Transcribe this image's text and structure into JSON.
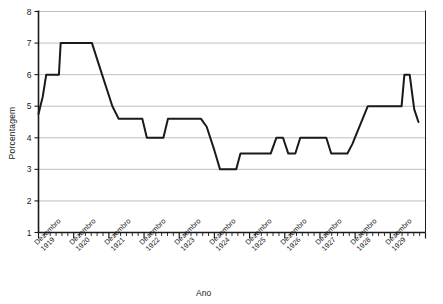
{
  "chart_data": {
    "type": "line",
    "title": "",
    "xlabel": "Ano",
    "ylabel": "Porcentagem",
    "ylim": [
      1,
      8
    ],
    "yticks": [
      1,
      2,
      3,
      4,
      5,
      6,
      7,
      8
    ],
    "grid": true,
    "legend": false,
    "categories": [
      "Dezembro 1919",
      "Dezembro 1920",
      "Dezembro 1921",
      "Dezembro 1922",
      "Dezembro 1923",
      "Dezembro 1924",
      "Dezembro 1925",
      "Dezembro 1926",
      "Dezembro 1927",
      "Dezembro 1928",
      "Dezembro 1929"
    ],
    "xtick_labels_line1": [
      "Dezembro",
      "Dezembro",
      "Dezembro",
      "Dezembro",
      "Dezembro",
      "Dezembro",
      "Dezembro",
      "Dezembro",
      "Dezembro",
      "Dezembro",
      "Dezembro"
    ],
    "xtick_labels_line2": [
      "1919",
      "1920",
      "1921",
      "1922",
      "1923",
      "1924",
      "1925",
      "1926",
      "1927",
      "1928",
      "1929"
    ],
    "series": [
      {
        "name": "Taxa de desconto",
        "color": "#1a1a1a",
        "points": [
          {
            "x": 1919.0,
            "y": 4.75
          },
          {
            "x": 1919.12,
            "y": 5.3
          },
          {
            "x": 1919.22,
            "y": 6.0
          },
          {
            "x": 1919.58,
            "y": 6.0
          },
          {
            "x": 1919.63,
            "y": 7.0
          },
          {
            "x": 1920.52,
            "y": 7.0
          },
          {
            "x": 1920.75,
            "y": 6.2
          },
          {
            "x": 1921.1,
            "y": 5.0
          },
          {
            "x": 1921.28,
            "y": 4.6
          },
          {
            "x": 1921.95,
            "y": 4.6
          },
          {
            "x": 1922.08,
            "y": 4.0
          },
          {
            "x": 1922.55,
            "y": 4.0
          },
          {
            "x": 1922.68,
            "y": 4.6
          },
          {
            "x": 1923.62,
            "y": 4.6
          },
          {
            "x": 1923.78,
            "y": 4.35
          },
          {
            "x": 1924.0,
            "y": 3.6
          },
          {
            "x": 1924.16,
            "y": 3.0
          },
          {
            "x": 1924.62,
            "y": 3.0
          },
          {
            "x": 1924.74,
            "y": 3.5
          },
          {
            "x": 1925.6,
            "y": 3.5
          },
          {
            "x": 1925.76,
            "y": 4.0
          },
          {
            "x": 1925.95,
            "y": 4.0
          },
          {
            "x": 1926.1,
            "y": 3.5
          },
          {
            "x": 1926.3,
            "y": 3.5
          },
          {
            "x": 1926.44,
            "y": 4.0
          },
          {
            "x": 1927.18,
            "y": 4.0
          },
          {
            "x": 1927.32,
            "y": 3.5
          },
          {
            "x": 1927.78,
            "y": 3.5
          },
          {
            "x": 1927.92,
            "y": 3.8
          },
          {
            "x": 1928.36,
            "y": 5.0
          },
          {
            "x": 1928.52,
            "y": 5.0
          },
          {
            "x": 1929.32,
            "y": 5.0
          },
          {
            "x": 1929.4,
            "y": 6.0
          },
          {
            "x": 1929.55,
            "y": 6.0
          },
          {
            "x": 1929.68,
            "y": 4.9
          },
          {
            "x": 1929.8,
            "y": 4.5
          }
        ]
      }
    ],
    "axis_colors": {
      "axis": "#1a1a1a",
      "gridline": "#b0b0b0",
      "line": "#1a1a1a"
    }
  }
}
